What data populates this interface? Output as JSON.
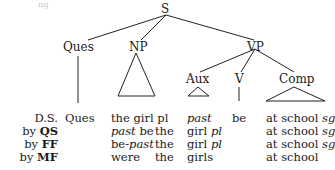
{
  "fragment": "ng",
  "tree": {
    "root": "S",
    "nodes": {
      "ques": "Ques",
      "np": "NP",
      "vp": "VP",
      "aux": "Aux",
      "v": "V",
      "comp": "Comp"
    }
  },
  "rows": [
    {
      "label_prefix": "",
      "label_rule": "D.S.",
      "ques": "Ques",
      "np": [
        "the girl pl"
      ],
      "aux": "past",
      "v": "be",
      "comp": "at school",
      "comp_suffix": "sg"
    },
    {
      "label_prefix": "by",
      "label_rule": "QS",
      "np_italic": "past",
      "np_rest": " be",
      "np_the": "the",
      "aux": "girl",
      "aux_suffix": "pl",
      "comp": "at school",
      "comp_suffix": "sg"
    },
    {
      "label_prefix": "by",
      "label_rule": "FF",
      "np_pre": "be-",
      "np_italic": "past",
      "np_the": "the",
      "aux": "girl",
      "aux_suffix": "pl",
      "comp": "at school",
      "comp_suffix": "sg"
    },
    {
      "label_prefix": "by",
      "label_rule": "MF",
      "np_word": "were",
      "np_the": "the",
      "aux": "girls",
      "comp": "at school"
    }
  ]
}
